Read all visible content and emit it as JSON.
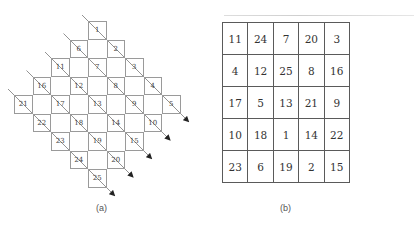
{
  "figure": {
    "panel_a": {
      "label": "(a)",
      "description": "5x5 grid arranged as a diamond; each row traversed by a diagonal arrow",
      "grid_size": 5,
      "cells": [
        [
          1,
          2,
          3,
          4,
          5
        ],
        [
          6,
          7,
          8,
          9,
          10
        ],
        [
          11,
          12,
          13,
          14,
          15
        ],
        [
          16,
          17,
          18,
          19,
          20
        ],
        [
          21,
          22,
          23,
          24,
          25
        ]
      ],
      "arrow_count": 5
    },
    "panel_b": {
      "label": "(b)",
      "rows": [
        [
          "11",
          "24",
          "7",
          "20",
          "3"
        ],
        [
          "4",
          "12",
          "25",
          "8",
          "16"
        ],
        [
          "17",
          "5",
          "13",
          "21",
          "9"
        ],
        [
          "10",
          "18",
          "1",
          "14",
          "22"
        ],
        [
          "23",
          "6",
          "19",
          "2",
          "15"
        ]
      ]
    },
    "caption": ""
  }
}
